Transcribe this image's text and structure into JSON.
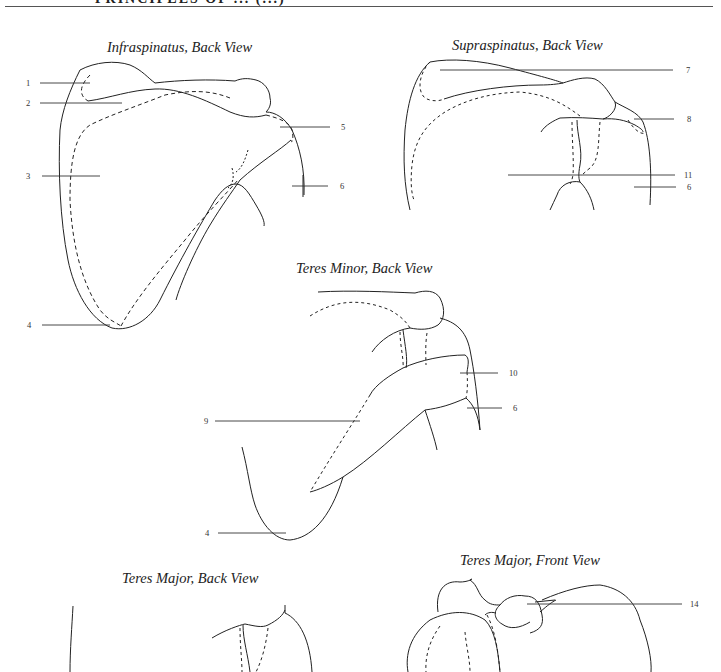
{
  "header": {
    "title_cropped": "PRINCIPLES OF ... (...)"
  },
  "figures": [
    {
      "title": "Infraspinatus, Back View",
      "labels": [
        "1",
        "2",
        "3",
        "4",
        "5",
        "6"
      ]
    },
    {
      "title": "Supraspinatus, Back View",
      "labels": [
        "7",
        "8",
        "11",
        "6"
      ]
    },
    {
      "title": "Teres Minor, Back View",
      "labels": [
        "10",
        "9",
        "6",
        "4"
      ]
    },
    {
      "title": "Teres Major, Back View",
      "labels": []
    },
    {
      "title": "Teres Major, Front View",
      "labels": [
        "14"
      ]
    }
  ],
  "colors": {
    "line": "#222222",
    "background": "#ffffff"
  }
}
